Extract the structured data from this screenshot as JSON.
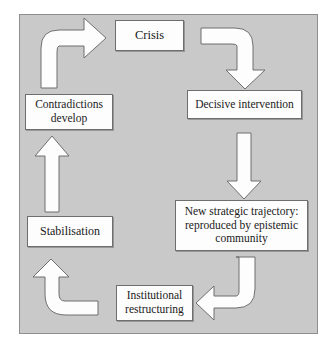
{
  "figure": {
    "panel_background_color": "#c9c9c9",
    "panel_border_color": "#8f8f8f",
    "node_fill_color": "#fdfdfd",
    "node_border_color": "#6e6e6e",
    "arrow_fill_color": "#fdfdfd",
    "arrow_border_color": "#6f6f6f"
  },
  "nodes": [
    {
      "id": "crisis",
      "label": "Crisis"
    },
    {
      "id": "decisive",
      "label": "Decisive intervention"
    },
    {
      "id": "trajectory",
      "label": "New strategic trajectory:\nreproduced by epistemic\ncommunity"
    },
    {
      "id": "institutional",
      "label": "Institutional\nrestructuring"
    },
    {
      "id": "stabilisation",
      "label": "Stabilisation"
    },
    {
      "id": "contradictions",
      "label": "Contradictions\ndevelop"
    }
  ],
  "arrows": [
    {
      "id": "crisis-to-decisive",
      "from": "crisis",
      "to": "decisive",
      "shape": "curved-right-down",
      "direction": "down"
    },
    {
      "id": "decisive-to-trajectory",
      "from": "decisive",
      "to": "trajectory",
      "shape": "straight",
      "direction": "down"
    },
    {
      "id": "trajectory-to-institutional",
      "from": "trajectory",
      "to": "institutional",
      "shape": "curved-down-left",
      "direction": "left"
    },
    {
      "id": "institutional-to-stabilisation",
      "from": "institutional",
      "to": "stabilisation",
      "shape": "curved-left-up",
      "direction": "up"
    },
    {
      "id": "stabilisation-to-contradictions",
      "from": "stabilisation",
      "to": "contradictions",
      "shape": "straight",
      "direction": "up"
    },
    {
      "id": "contradictions-to-crisis",
      "from": "contradictions",
      "to": "crisis",
      "shape": "curved-up-right",
      "direction": "right"
    }
  ]
}
